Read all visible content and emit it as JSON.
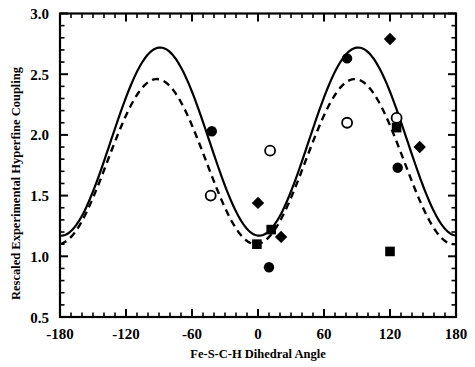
{
  "chart_data": {
    "type": "scatter",
    "title": "",
    "xlabel": "Fe-S-C-H Dihedral Angle",
    "ylabel": "Rescaled Experimental Hyperfine Coupling",
    "xlim": [
      -180,
      180
    ],
    "ylim": [
      0.5,
      3.0
    ],
    "xticks": [
      -180,
      -120,
      -60,
      0,
      60,
      120,
      180
    ],
    "xtick_labels": [
      "-180",
      "-120",
      "-60",
      "0",
      "60",
      "120",
      "180"
    ],
    "yticks": [
      0.5,
      1.0,
      1.5,
      2.0,
      2.5,
      3.0
    ],
    "ytick_labels": [
      "0.5",
      "1.0",
      "1.5",
      "2.0",
      "2.5",
      "3.0"
    ],
    "x_minor_tick_interval": 10,
    "y_minor_tick_interval": 0.1,
    "grid": false,
    "legend": "none",
    "series": [
      {
        "name": "solid-fit-curve",
        "type": "line",
        "style": "solid",
        "color": "#000000",
        "model": "A + B*cos^2(theta - phi)",
        "A": 1.17,
        "B": 1.55,
        "phi": 91,
        "baseline_at_180": 1.29,
        "peak_left": {
          "x": -91,
          "y": 2.72
        },
        "peak_right": {
          "x": 94,
          "y": 2.72
        },
        "minimum": {
          "x": 3,
          "y": 1.17
        }
      },
      {
        "name": "dashed-fit-curve",
        "type": "line",
        "style": "dashed",
        "color": "#000000",
        "model": "A + B*cos^2(theta - phi)",
        "A": 1.1,
        "B": 1.36,
        "phi": 88,
        "baseline_at_180": 1.19,
        "peak_left": {
          "x": -88,
          "y": 2.46
        },
        "peak_right": {
          "x": 90,
          "y": 2.46
        },
        "minimum": {
          "x": 0,
          "y": 1.1
        }
      },
      {
        "name": "filled-circle-points",
        "type": "scatter",
        "marker": "filled-circle",
        "color": "#000000",
        "points": [
          {
            "x": -42,
            "y": 2.03
          },
          {
            "x": 81,
            "y": 2.63
          },
          {
            "x": 127,
            "y": 1.73
          },
          {
            "x": 10,
            "y": 0.91
          }
        ]
      },
      {
        "name": "open-circle-points",
        "type": "scatter",
        "marker": "open-circle",
        "color": "#000000",
        "points": [
          {
            "x": -43,
            "y": 1.5
          },
          {
            "x": 11,
            "y": 1.87
          },
          {
            "x": 81,
            "y": 2.1
          },
          {
            "x": 126,
            "y": 2.14
          }
        ]
      },
      {
        "name": "filled-diamond-points",
        "type": "scatter",
        "marker": "filled-diamond",
        "color": "#000000",
        "points": [
          {
            "x": 0,
            "y": 1.44
          },
          {
            "x": 21,
            "y": 1.16
          },
          {
            "x": 120,
            "y": 2.79
          },
          {
            "x": 147,
            "y": 1.9
          }
        ]
      },
      {
        "name": "filled-square-points",
        "type": "scatter",
        "marker": "filled-square",
        "color": "#000000",
        "points": [
          {
            "x": 12,
            "y": 1.22
          },
          {
            "x": -1,
            "y": 1.1
          },
          {
            "x": 126,
            "y": 2.06
          },
          {
            "x": 120,
            "y": 1.04
          }
        ]
      }
    ]
  },
  "axes": {
    "y_title": "Rescaled Experimental Hyperfine Coupling",
    "x_title": "Fe-S-C-H Dihedral Angle"
  }
}
